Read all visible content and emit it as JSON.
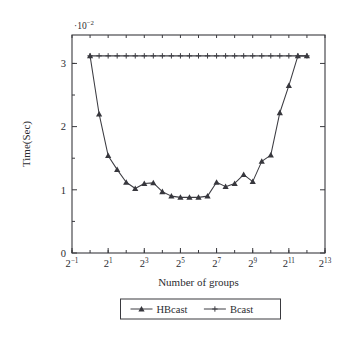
{
  "chart_data": {
    "type": "line",
    "title": "",
    "xlabel": "Number of groups",
    "ylabel": "Time(Sec)",
    "y_multiplier": "·10⁻²",
    "y_multiplier_base": "·10",
    "y_multiplier_exp": "−2",
    "grid": false,
    "legend_position": "below-axis-center",
    "x_scale": "log2",
    "x_tick_labels": [
      "2⁻¹",
      "2¹",
      "2³",
      "2⁵",
      "2⁷",
      "2⁹",
      "2¹¹",
      "2¹³"
    ],
    "x_tick_bases": [
      "2",
      "2",
      "2",
      "2",
      "2",
      "2",
      "2",
      "2"
    ],
    "x_tick_exponents": [
      "−1",
      "1",
      "3",
      "5",
      "7",
      "9",
      "11",
      "13"
    ],
    "x_tick_exponent_values": [
      -1,
      1,
      3,
      5,
      7,
      9,
      11,
      13
    ],
    "xlim_exponent": [
      -1,
      13
    ],
    "y_tick_labels": [
      "0",
      "1",
      "2",
      "3"
    ],
    "y_tick_values": [
      0,
      1,
      2,
      3
    ],
    "ylim": [
      0,
      3.45
    ],
    "x_exponents": [
      0,
      0.5,
      1,
      1.5,
      2,
      2.5,
      3,
      3.5,
      4,
      4.5,
      5,
      5.5,
      6,
      6.5,
      7,
      7.5,
      8,
      8.5,
      9,
      9.5,
      10,
      10.5,
      11,
      11.5,
      12
    ],
    "series": [
      {
        "name": "HBcast",
        "marker": "triangle",
        "values": [
          3.12,
          2.2,
          1.54,
          1.32,
          1.12,
          1.02,
          1.1,
          1.11,
          0.97,
          0.9,
          0.88,
          0.88,
          0.88,
          0.9,
          1.12,
          1.05,
          1.1,
          1.24,
          1.13,
          1.45,
          1.55,
          2.22,
          2.65,
          3.12,
          3.12
        ]
      },
      {
        "name": "Bcast",
        "marker": "plus",
        "values": [
          3.12,
          3.12,
          3.12,
          3.12,
          3.12,
          3.12,
          3.12,
          3.12,
          3.12,
          3.12,
          3.12,
          3.12,
          3.12,
          3.12,
          3.12,
          3.12,
          3.12,
          3.12,
          3.12,
          3.12,
          3.12,
          3.12,
          3.12,
          3.12,
          3.12
        ]
      }
    ]
  },
  "legend": {
    "entries": [
      {
        "label": "HBcast",
        "marker": "triangle"
      },
      {
        "label": "Bcast",
        "marker": "plus"
      }
    ]
  },
  "colors": {
    "line": "#3c3c42",
    "axis": "#3a3a3f",
    "text": "#2b2b30",
    "background": "#ffffff"
  }
}
